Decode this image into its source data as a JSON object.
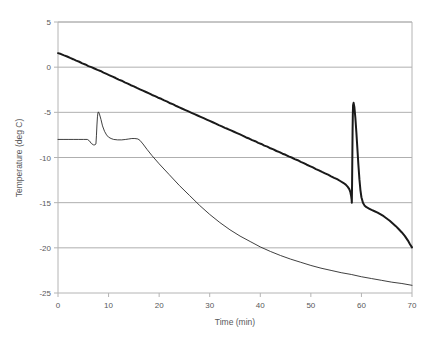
{
  "chart_data": {
    "type": "line",
    "title": "",
    "xlabel": "Time (min)",
    "ylabel": "Temperature (deg C)",
    "xlim": [
      0,
      70
    ],
    "ylim": [
      -25,
      5
    ],
    "xticks": [
      0,
      10,
      20,
      30,
      40,
      50,
      60,
      70
    ],
    "yticks": [
      5,
      0,
      -5,
      -10,
      -15,
      -20,
      -25
    ],
    "xticklabels": [
      "0",
      "10",
      "20",
      "30",
      "40",
      "50",
      "60",
      "70"
    ],
    "yticklabels": [
      "5",
      "0",
      "-5",
      "-10",
      "-15",
      "-20",
      "-25"
    ],
    "grid": "horizontal",
    "grid_color": "#9a9a9a",
    "axis_color": "#b4b4b4",
    "legend": "none",
    "series": [
      {
        "name": "thick-noisy-curve",
        "color": "#1a1a1a",
        "width": 2.0,
        "points": [
          [
            0.0,
            1.55
          ],
          [
            0.6,
            1.45
          ],
          [
            1.2,
            1.3
          ],
          [
            1.8,
            1.18
          ],
          [
            2.4,
            1.02
          ],
          [
            3.0,
            0.88
          ],
          [
            3.6,
            0.72
          ],
          [
            4.2,
            0.6
          ],
          [
            4.8,
            0.42
          ],
          [
            5.4,
            0.3
          ],
          [
            6.0,
            0.12
          ],
          [
            6.6,
            0.0
          ],
          [
            7.2,
            -0.15
          ],
          [
            7.8,
            -0.3
          ],
          [
            8.4,
            -0.42
          ],
          [
            9.0,
            -0.6
          ],
          [
            9.6,
            -0.75
          ],
          [
            10.2,
            -0.9
          ],
          [
            10.8,
            -1.05
          ],
          [
            11.4,
            -1.2
          ],
          [
            12.0,
            -1.38
          ],
          [
            12.6,
            -1.5
          ],
          [
            13.2,
            -1.68
          ],
          [
            13.8,
            -1.82
          ],
          [
            14.4,
            -2.0
          ],
          [
            15.0,
            -2.12
          ],
          [
            15.6,
            -2.3
          ],
          [
            16.2,
            -2.45
          ],
          [
            16.8,
            -2.6
          ],
          [
            17.4,
            -2.75
          ],
          [
            18.0,
            -2.9
          ],
          [
            18.6,
            -3.08
          ],
          [
            19.2,
            -3.2
          ],
          [
            19.8,
            -3.38
          ],
          [
            20.4,
            -3.5
          ],
          [
            21.0,
            -3.68
          ],
          [
            21.6,
            -3.82
          ],
          [
            22.2,
            -4.0
          ],
          [
            22.8,
            -4.12
          ],
          [
            23.4,
            -4.3
          ],
          [
            24.0,
            -4.45
          ],
          [
            24.6,
            -4.6
          ],
          [
            25.2,
            -4.75
          ],
          [
            25.8,
            -4.9
          ],
          [
            26.4,
            -5.05
          ],
          [
            27.0,
            -5.2
          ],
          [
            27.6,
            -5.35
          ],
          [
            28.2,
            -5.5
          ],
          [
            28.8,
            -5.65
          ],
          [
            29.4,
            -5.8
          ],
          [
            30.0,
            -5.95
          ],
          [
            30.6,
            -6.1
          ],
          [
            31.2,
            -6.25
          ],
          [
            31.8,
            -6.42
          ],
          [
            32.4,
            -6.55
          ],
          [
            33.0,
            -6.72
          ],
          [
            33.6,
            -6.85
          ],
          [
            34.2,
            -7.0
          ],
          [
            34.8,
            -7.15
          ],
          [
            35.4,
            -7.3
          ],
          [
            36.0,
            -7.45
          ],
          [
            36.6,
            -7.6
          ],
          [
            37.2,
            -7.78
          ],
          [
            37.8,
            -7.9
          ],
          [
            38.4,
            -8.08
          ],
          [
            39.0,
            -8.2
          ],
          [
            39.6,
            -8.38
          ],
          [
            40.2,
            -8.5
          ],
          [
            40.8,
            -8.68
          ],
          [
            41.4,
            -8.8
          ],
          [
            42.0,
            -8.98
          ],
          [
            42.6,
            -9.1
          ],
          [
            43.2,
            -9.28
          ],
          [
            43.8,
            -9.4
          ],
          [
            44.4,
            -9.58
          ],
          [
            45.0,
            -9.7
          ],
          [
            45.6,
            -9.88
          ],
          [
            46.2,
            -10.0
          ],
          [
            46.8,
            -10.18
          ],
          [
            47.4,
            -10.3
          ],
          [
            48.0,
            -10.48
          ],
          [
            48.6,
            -10.62
          ],
          [
            49.2,
            -10.8
          ],
          [
            49.8,
            -10.95
          ],
          [
            50.4,
            -11.1
          ],
          [
            51.0,
            -11.28
          ],
          [
            51.6,
            -11.42
          ],
          [
            52.2,
            -11.6
          ],
          [
            52.8,
            -11.75
          ],
          [
            53.4,
            -11.9
          ],
          [
            54.0,
            -12.08
          ],
          [
            54.6,
            -12.25
          ],
          [
            55.2,
            -12.4
          ],
          [
            55.8,
            -12.6
          ],
          [
            56.4,
            -12.8
          ],
          [
            56.9,
            -13.0
          ],
          [
            57.3,
            -13.25
          ],
          [
            57.6,
            -13.5
          ],
          [
            57.8,
            -13.8
          ],
          [
            57.95,
            -14.2
          ],
          [
            58.05,
            -14.6
          ],
          [
            58.1,
            -15.0
          ],
          [
            58.15,
            -13.0
          ],
          [
            58.2,
            -10.0
          ],
          [
            58.25,
            -7.0
          ],
          [
            58.3,
            -5.2
          ],
          [
            58.35,
            -4.2
          ],
          [
            58.45,
            -3.95
          ],
          [
            58.6,
            -4.4
          ],
          [
            58.8,
            -5.6
          ],
          [
            59.0,
            -7.2
          ],
          [
            59.2,
            -9.0
          ],
          [
            59.4,
            -10.8
          ],
          [
            59.6,
            -12.4
          ],
          [
            59.8,
            -13.6
          ],
          [
            60.0,
            -14.4
          ],
          [
            60.3,
            -15.0
          ],
          [
            60.6,
            -15.3
          ],
          [
            61.0,
            -15.5
          ],
          [
            61.5,
            -15.65
          ],
          [
            62.0,
            -15.8
          ],
          [
            62.6,
            -15.95
          ],
          [
            63.2,
            -16.1
          ],
          [
            63.8,
            -16.3
          ],
          [
            64.4,
            -16.5
          ],
          [
            65.0,
            -16.75
          ],
          [
            65.6,
            -17.0
          ],
          [
            66.2,
            -17.3
          ],
          [
            66.8,
            -17.6
          ],
          [
            67.4,
            -17.95
          ],
          [
            68.0,
            -18.3
          ],
          [
            68.6,
            -18.7
          ],
          [
            69.2,
            -19.2
          ],
          [
            69.6,
            -19.6
          ],
          [
            70.0,
            -19.95
          ]
        ]
      },
      {
        "name": "thin-smooth-curve",
        "color": "#2a2a2a",
        "width": 0.9,
        "points": [
          [
            0.0,
            -8.0
          ],
          [
            1.0,
            -8.0
          ],
          [
            2.0,
            -8.0
          ],
          [
            3.0,
            -8.0
          ],
          [
            4.0,
            -8.0
          ],
          [
            5.0,
            -8.0
          ],
          [
            5.8,
            -8.0
          ],
          [
            6.2,
            -8.15
          ],
          [
            6.6,
            -8.45
          ],
          [
            7.0,
            -8.6
          ],
          [
            7.3,
            -8.6
          ],
          [
            7.5,
            -8.5
          ],
          [
            7.6,
            -7.6
          ],
          [
            7.7,
            -6.4
          ],
          [
            7.8,
            -5.5
          ],
          [
            7.9,
            -5.05
          ],
          [
            8.0,
            -4.95
          ],
          [
            8.2,
            -5.2
          ],
          [
            8.5,
            -5.8
          ],
          [
            8.8,
            -6.5
          ],
          [
            9.2,
            -7.1
          ],
          [
            9.6,
            -7.5
          ],
          [
            10.0,
            -7.75
          ],
          [
            10.5,
            -7.9
          ],
          [
            11.0,
            -8.0
          ],
          [
            11.8,
            -8.05
          ],
          [
            12.6,
            -8.05
          ],
          [
            13.4,
            -8.0
          ],
          [
            14.0,
            -7.95
          ],
          [
            14.6,
            -7.9
          ],
          [
            15.2,
            -7.9
          ],
          [
            15.8,
            -7.95
          ],
          [
            16.2,
            -8.1
          ],
          [
            16.8,
            -8.5
          ],
          [
            17.6,
            -9.1
          ],
          [
            18.6,
            -9.8
          ],
          [
            20.0,
            -10.7
          ],
          [
            22.0,
            -11.9
          ],
          [
            24.0,
            -13.1
          ],
          [
            26.0,
            -14.2
          ],
          [
            28.0,
            -15.3
          ],
          [
            30.0,
            -16.3
          ],
          [
            32.0,
            -17.2
          ],
          [
            34.0,
            -18.0
          ],
          [
            36.0,
            -18.7
          ],
          [
            38.0,
            -19.3
          ],
          [
            40.0,
            -19.9
          ],
          [
            42.0,
            -20.4
          ],
          [
            44.0,
            -20.85
          ],
          [
            46.0,
            -21.25
          ],
          [
            48.0,
            -21.6
          ],
          [
            50.0,
            -21.95
          ],
          [
            52.0,
            -22.25
          ],
          [
            54.0,
            -22.5
          ],
          [
            56.0,
            -22.75
          ],
          [
            58.0,
            -22.95
          ],
          [
            60.0,
            -23.2
          ],
          [
            62.0,
            -23.4
          ],
          [
            64.0,
            -23.6
          ],
          [
            66.0,
            -23.8
          ],
          [
            68.0,
            -23.95
          ],
          [
            70.0,
            -24.15
          ]
        ]
      }
    ]
  }
}
